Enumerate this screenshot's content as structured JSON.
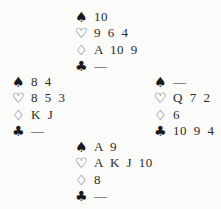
{
  "suits": {
    "spades": "♠",
    "hearts": "♡",
    "diamonds": "♢",
    "clubs": "♣"
  },
  "hands": {
    "north": {
      "spades": "10",
      "hearts": "9 6 4",
      "diamonds": "A 10 9",
      "clubs": "—"
    },
    "west": {
      "spades": "8 4",
      "hearts": "8 5 3",
      "diamonds": "K J",
      "clubs": "—"
    },
    "east": {
      "spades": "—",
      "hearts": "Q 7 2",
      "diamonds": "6",
      "clubs": "10 9 4"
    },
    "south": {
      "spades": "A 9",
      "hearts": "A K J 10",
      "diamonds": "8",
      "clubs": "—"
    }
  }
}
